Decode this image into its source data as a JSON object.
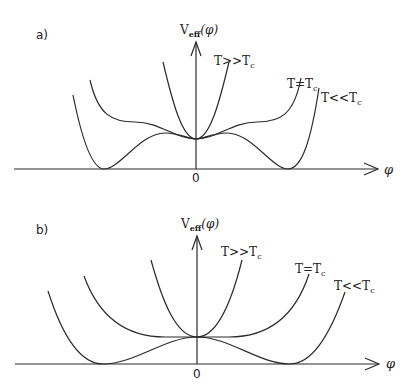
{
  "panels": [
    {
      "id": "a",
      "label": "a)",
      "y_axis_label": "V",
      "y_axis_sub": "eff",
      "y_axis_arg": "(φ)",
      "x_axis_label": "φ",
      "origin_label": "0",
      "curves": [
        {
          "name": "T>>Tc",
          "label": "T>>T",
          "sub": "c"
        },
        {
          "name": "T=Tc",
          "label": "T=T",
          "sub": "c"
        },
        {
          "name": "T<<Tc",
          "label": "T<<T",
          "sub": "c"
        }
      ]
    },
    {
      "id": "b",
      "label": "b)",
      "y_axis_label": "V",
      "y_axis_sub": "eff",
      "y_axis_arg": "(φ)",
      "x_axis_label": "φ",
      "origin_label": "0",
      "curves": [
        {
          "name": "T>>Tc",
          "label": "T>>T",
          "sub": "c"
        },
        {
          "name": "T=Tc",
          "label": "T=T",
          "sub": "c"
        },
        {
          "name": "T<<Tc",
          "label": "T<<T",
          "sub": "c"
        }
      ]
    }
  ]
}
